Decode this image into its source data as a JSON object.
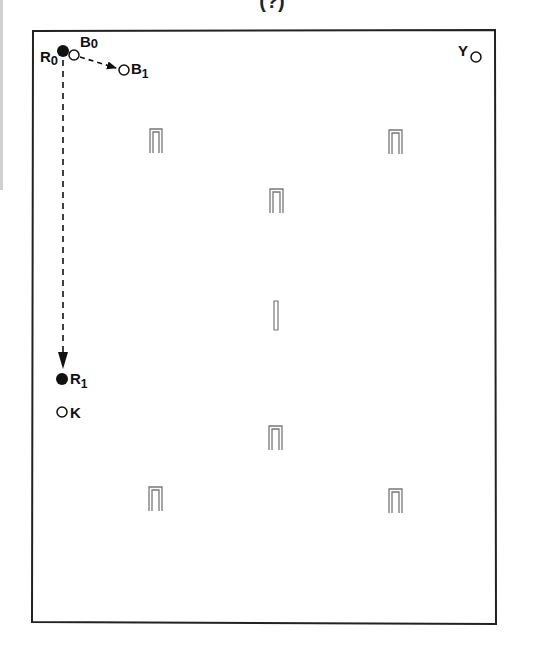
{
  "figure": {
    "title": "(?)",
    "frame": {
      "x": 32,
      "y": 30,
      "width": 464,
      "height": 594
    }
  },
  "labels": {
    "R0": {
      "main": "R",
      "sub": "0"
    },
    "B0": {
      "main": "B",
      "sub": "0"
    },
    "B1": {
      "main": "B",
      "sub": "1"
    },
    "R1": {
      "main": "R",
      "sub": "1"
    },
    "K": {
      "main": "K"
    },
    "Y": {
      "main": "Y"
    }
  },
  "markers": [
    {
      "id": "R0",
      "type": "filled",
      "x": 63,
      "y": 51
    },
    {
      "id": "B0",
      "type": "open",
      "x": 74,
      "y": 55
    },
    {
      "id": "B1",
      "type": "open",
      "x": 124,
      "y": 70
    },
    {
      "id": "R1",
      "type": "filled",
      "x": 62,
      "y": 379
    },
    {
      "id": "K",
      "type": "open",
      "x": 62,
      "y": 412
    },
    {
      "id": "Y",
      "type": "open",
      "x": 476,
      "y": 55
    }
  ],
  "arrows": [
    {
      "from": "B0",
      "to": "B1",
      "style": "dashed"
    },
    {
      "from": "R0",
      "to": "R1",
      "style": "dashed"
    }
  ],
  "staples": [
    {
      "x": 155,
      "y": 140,
      "kind": "arch"
    },
    {
      "x": 395,
      "y": 141,
      "kind": "arch"
    },
    {
      "x": 276,
      "y": 200,
      "kind": "arch"
    },
    {
      "x": 275,
      "y": 315,
      "kind": "bar"
    },
    {
      "x": 275,
      "y": 437,
      "kind": "arch"
    },
    {
      "x": 155,
      "y": 498,
      "kind": "arch"
    },
    {
      "x": 395,
      "y": 500,
      "kind": "arch"
    }
  ]
}
